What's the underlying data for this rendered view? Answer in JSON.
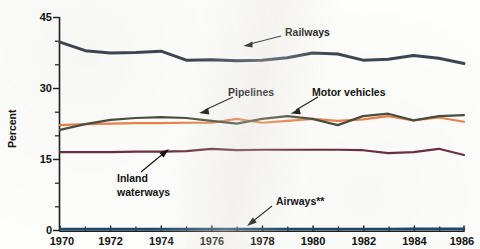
{
  "chart_data": {
    "type": "line",
    "title": "",
    "xlabel": "",
    "ylabel": "Percent",
    "xlim": [
      1970,
      1986
    ],
    "ylim": [
      0,
      45
    ],
    "yticks": [
      0,
      15,
      30,
      45
    ],
    "ytick_labels": [
      "0",
      "15",
      "30",
      "45"
    ],
    "yticks_minor": [
      5,
      10,
      20,
      25,
      35,
      40
    ],
    "xticks": [
      1970,
      1972,
      1974,
      1976,
      1978,
      1980,
      1982,
      1984,
      1986
    ],
    "xtick_labels": [
      "1970",
      "1972",
      "1974",
      "1976",
      "1978",
      "1980",
      "1982",
      "1984",
      "1986"
    ],
    "xticks_minor": [
      1971,
      1973,
      1975,
      1977,
      1979,
      1981,
      1983,
      1985
    ],
    "grid": false,
    "legend": "annotations",
    "x": [
      1970,
      1971,
      1972,
      1973,
      1974,
      1975,
      1976,
      1977,
      1978,
      1979,
      1980,
      1981,
      1982,
      1983,
      1984,
      1985,
      1986
    ],
    "series": [
      {
        "name": "Railways",
        "color": "#3c4650",
        "values": [
          39.8,
          38.0,
          37.5,
          37.6,
          37.9,
          36.0,
          36.1,
          35.9,
          36.0,
          36.5,
          37.5,
          37.3,
          36.0,
          36.2,
          37.0,
          36.4,
          35.3
        ]
      },
      {
        "name": "Pipelines",
        "color": "#e8824a",
        "values": [
          22.3,
          22.5,
          22.6,
          22.7,
          22.7,
          22.8,
          22.8,
          23.6,
          22.8,
          23.2,
          23.6,
          23.2,
          23.5,
          24.2,
          23.3,
          23.9,
          23.0
        ]
      },
      {
        "name": "Motor vehicles",
        "color": "#4a4f3d",
        "values": [
          21.3,
          22.5,
          23.4,
          23.8,
          24.0,
          23.8,
          23.2,
          22.6,
          23.6,
          24.2,
          23.6,
          22.3,
          24.2,
          24.7,
          23.3,
          24.2,
          24.4
        ]
      },
      {
        "name": "Inland waterways",
        "color": "#6b2f44",
        "values": [
          16.6,
          16.6,
          16.6,
          16.7,
          16.7,
          16.8,
          17.3,
          17.0,
          17.1,
          17.1,
          17.1,
          17.1,
          17.0,
          16.4,
          16.6,
          17.3,
          16.0
        ]
      },
      {
        "name": "Airways**",
        "color": "#1d4a6b",
        "values": [
          0.35,
          0.35,
          0.35,
          0.35,
          0.36,
          0.36,
          0.37,
          0.37,
          0.38,
          0.38,
          0.38,
          0.38,
          0.39,
          0.39,
          0.4,
          0.4,
          0.4
        ]
      }
    ],
    "annotations": [
      {
        "label": "Railways",
        "x": 285,
        "y": 32
      },
      {
        "label": "Pipelines",
        "x": 225,
        "y": 92
      },
      {
        "label": "Motor vehicles",
        "x": 310,
        "y": 92
      },
      {
        "label": "Inland",
        "x": 127,
        "y": 176
      },
      {
        "label": "waterways",
        "x": 127,
        "y": 190
      },
      {
        "label": "Airways**",
        "x": 276,
        "y": 203
      }
    ]
  }
}
